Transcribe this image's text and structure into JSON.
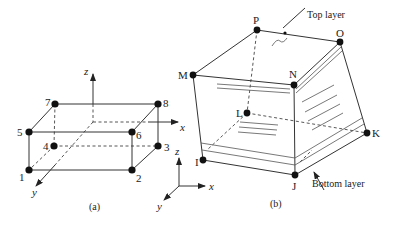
{
  "figure_a": {
    "caption": "(a)",
    "nodes": [
      "1",
      "2",
      "3",
      "4",
      "5",
      "6",
      "7",
      "8"
    ],
    "axes": {
      "x": "x",
      "y": "y",
      "z": "z"
    }
  },
  "figure_b": {
    "caption": "(b)",
    "nodes": [
      "I",
      "J",
      "K",
      "L",
      "M",
      "N",
      "O",
      "P"
    ],
    "top_layer_label": "Top layer",
    "bottom_layer_label": "Bottom layer",
    "axes": {
      "x": "x",
      "y": "y",
      "z": "z"
    }
  }
}
